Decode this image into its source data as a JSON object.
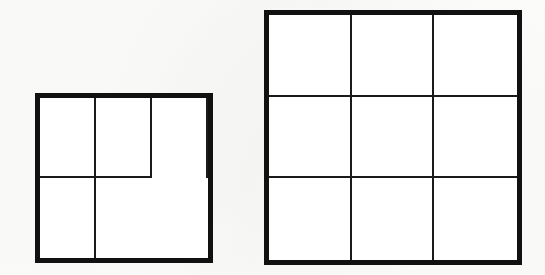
{
  "page": {
    "background_color": "#fcfcfb",
    "width": 545,
    "height": 275
  },
  "style": {
    "outer_border_color": "#111111",
    "outer_border_width_px": 5,
    "inner_line_color": "#1a1a1a",
    "inner_line_width_px": 2,
    "cell_fill_color": "#ffffff"
  },
  "figures": [
    {
      "name": "small-square-2x2",
      "label": "Small square divided into 4 equal parts",
      "shape": "square",
      "rows": 2,
      "columns": 3,
      "cell_count": 4,
      "x": 35,
      "y": 93,
      "width": 178,
      "height": 170,
      "cells": [
        {
          "row": 1,
          "column": 1,
          "label": ""
        },
        {
          "row": 1,
          "column": 2,
          "label": ""
        },
        {
          "row": 2,
          "column": 1,
          "label": ""
        },
        {
          "row": 2,
          "column": 2,
          "label": ""
        }
      ]
    },
    {
      "name": "large-square-3x3",
      "label": "Large square divided into 9 equal parts",
      "shape": "square",
      "rows": 3,
      "columns": 3,
      "cell_count": 9,
      "x": 264,
      "y": 10,
      "width": 258,
      "height": 255,
      "cells": [
        {
          "row": 1,
          "column": 1,
          "label": ""
        },
        {
          "row": 1,
          "column": 2,
          "label": ""
        },
        {
          "row": 1,
          "column": 3,
          "label": ""
        },
        {
          "row": 2,
          "column": 1,
          "label": ""
        },
        {
          "row": 2,
          "column": 2,
          "label": ""
        },
        {
          "row": 2,
          "column": 3,
          "label": ""
        },
        {
          "row": 3,
          "column": 1,
          "label": ""
        },
        {
          "row": 3,
          "column": 2,
          "label": ""
        },
        {
          "row": 3,
          "column": 3,
          "label": ""
        }
      ]
    }
  ]
}
